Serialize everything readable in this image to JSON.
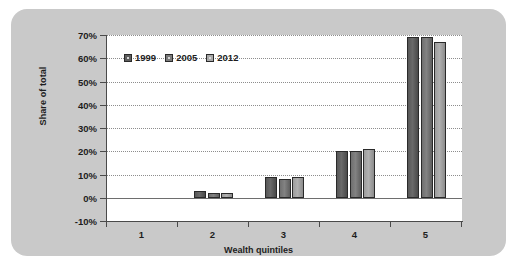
{
  "chart_data": {
    "type": "bar",
    "title": "",
    "xlabel": "Wealth quintiles",
    "ylabel": "Share of total",
    "categories": [
      "1",
      "2",
      "3",
      "4",
      "5"
    ],
    "series": [
      {
        "name": "1999",
        "values": [
          0,
          3,
          9,
          20,
          69
        ],
        "color": "#5e5e5e"
      },
      {
        "name": "2005",
        "values": [
          0,
          2,
          8,
          20,
          69
        ],
        "color": "#7b7b7b"
      },
      {
        "name": "2012",
        "values": [
          0,
          2,
          9,
          21,
          67
        ],
        "color": "#a8a8a8"
      }
    ],
    "ylim": [
      -10,
      70
    ],
    "ytick_values": [
      70,
      60,
      50,
      40,
      30,
      20,
      10,
      0,
      -10
    ],
    "ytick_labels": [
      "70%",
      "60%",
      "50%",
      "40%",
      "30%",
      "20%",
      "10%",
      "0%",
      "-10%"
    ],
    "grid": true,
    "legend_position": "top-left",
    "panel_color": "#c9c9c9",
    "plot_background": "#ffffff",
    "axis_color": "#4a4a4a",
    "gridline_color": "#8d8d8d"
  }
}
